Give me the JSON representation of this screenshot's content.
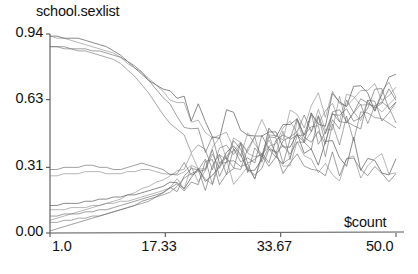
{
  "chart_data": {
    "type": "line",
    "title": "school.sexlist",
    "xlabel": "$count",
    "ylabel": "",
    "xlim": [
      1.0,
      50.0
    ],
    "ylim": [
      0.0,
      0.94
    ],
    "grid": false,
    "legend": false,
    "xticks": [
      1.0,
      17.33,
      33.67,
      50.0
    ],
    "xticklabels": [
      "1.0",
      "17.33",
      "33.67",
      "50.0"
    ],
    "yticks": [
      0.0,
      0.31,
      0.63,
      0.94
    ],
    "yticklabels": [
      "0.00",
      "0.31",
      "0.63",
      "0.94"
    ],
    "line_color": "#6e6e6e",
    "axis_color": "#555555",
    "x": [
      1,
      2,
      3,
      4,
      5,
      6,
      7,
      8,
      9,
      10,
      11,
      12,
      13,
      14,
      15,
      16,
      17,
      18,
      19,
      20,
      21,
      22,
      23,
      24,
      25,
      26,
      27,
      28,
      29,
      30,
      31,
      32,
      33,
      34,
      35,
      36,
      37,
      38,
      39,
      40,
      41,
      42,
      43,
      44,
      45,
      46,
      47,
      48,
      49,
      50
    ],
    "series": [
      {
        "name": "trace-1",
        "values": [
          0.93,
          0.93,
          0.92,
          0.92,
          0.92,
          0.91,
          0.9,
          0.89,
          0.88,
          0.86,
          0.84,
          0.81,
          0.78,
          0.75,
          0.72,
          0.7,
          0.68,
          0.66,
          0.63,
          0.61,
          0.58,
          0.56,
          0.55,
          0.53,
          0.52,
          0.5,
          0.49,
          0.48,
          0.47,
          0.45,
          0.44,
          0.43,
          0.43,
          0.42,
          0.41,
          0.41,
          0.4,
          0.4,
          0.39,
          0.39,
          0.38,
          0.38,
          0.37,
          0.37,
          0.36,
          0.36,
          0.35,
          0.35,
          0.34,
          0.33
        ]
      },
      {
        "name": "trace-2",
        "values": [
          0.93,
          0.92,
          0.92,
          0.91,
          0.9,
          0.89,
          0.88,
          0.87,
          0.86,
          0.85,
          0.83,
          0.8,
          0.78,
          0.76,
          0.73,
          0.7,
          0.67,
          0.64,
          0.61,
          0.58,
          0.55,
          0.52,
          0.5,
          0.48,
          0.46,
          0.44,
          0.43,
          0.42,
          0.41,
          0.4,
          0.39,
          0.38,
          0.37,
          0.37,
          0.36,
          0.36,
          0.35,
          0.35,
          0.34,
          0.34,
          0.33,
          0.33,
          0.32,
          0.32,
          0.32,
          0.31,
          0.31,
          0.31,
          0.3,
          0.3
        ]
      },
      {
        "name": "trace-3",
        "values": [
          0.88,
          0.88,
          0.88,
          0.87,
          0.87,
          0.87,
          0.86,
          0.86,
          0.85,
          0.84,
          0.83,
          0.81,
          0.79,
          0.76,
          0.72,
          0.68,
          0.64,
          0.6,
          0.55,
          0.5,
          0.46,
          0.43,
          0.41,
          0.39,
          0.38,
          0.37,
          0.36,
          0.36,
          0.35,
          0.35,
          0.34,
          0.34,
          0.34,
          0.33,
          0.33,
          0.33,
          0.33,
          0.33,
          0.32,
          0.32,
          0.32,
          0.32,
          0.32,
          0.32,
          0.31,
          0.31,
          0.31,
          0.31,
          0.31,
          0.3
        ]
      },
      {
        "name": "trace-4",
        "values": [
          0.88,
          0.88,
          0.87,
          0.87,
          0.86,
          0.86,
          0.85,
          0.84,
          0.83,
          0.82,
          0.8,
          0.77,
          0.74,
          0.7,
          0.66,
          0.61,
          0.56,
          0.51,
          0.47,
          0.44,
          0.41,
          0.39,
          0.38,
          0.37,
          0.36,
          0.36,
          0.36,
          0.36,
          0.36,
          0.36,
          0.37,
          0.37,
          0.38,
          0.38,
          0.39,
          0.4,
          0.41,
          0.42,
          0.43,
          0.44,
          0.45,
          0.46,
          0.47,
          0.48,
          0.5,
          0.51,
          0.52,
          0.53,
          0.54,
          0.55
        ]
      },
      {
        "name": "trace-5",
        "values": [
          0.3,
          0.3,
          0.31,
          0.31,
          0.31,
          0.32,
          0.32,
          0.31,
          0.31,
          0.3,
          0.3,
          0.31,
          0.32,
          0.33,
          0.32,
          0.31,
          0.3,
          0.29,
          0.3,
          0.31,
          0.32,
          0.31,
          0.3,
          0.31,
          0.32,
          0.33,
          0.34,
          0.33,
          0.32,
          0.33,
          0.34,
          0.36,
          0.37,
          0.38,
          0.4,
          0.42,
          0.44,
          0.46,
          0.48,
          0.5,
          0.52,
          0.55,
          0.57,
          0.59,
          0.61,
          0.62,
          0.63,
          0.64,
          0.65,
          0.66
        ]
      },
      {
        "name": "trace-6",
        "values": [
          0.27,
          0.27,
          0.28,
          0.28,
          0.28,
          0.29,
          0.29,
          0.29,
          0.28,
          0.28,
          0.28,
          0.29,
          0.29,
          0.3,
          0.3,
          0.29,
          0.28,
          0.27,
          0.27,
          0.28,
          0.29,
          0.3,
          0.29,
          0.28,
          0.29,
          0.3,
          0.31,
          0.3,
          0.31,
          0.33,
          0.35,
          0.37,
          0.39,
          0.41,
          0.43,
          0.45,
          0.47,
          0.49,
          0.51,
          0.53,
          0.55,
          0.57,
          0.58,
          0.6,
          0.61,
          0.62,
          0.63,
          0.64,
          0.64,
          0.65
        ]
      },
      {
        "name": "trace-7",
        "values": [
          0.13,
          0.13,
          0.14,
          0.14,
          0.14,
          0.15,
          0.15,
          0.16,
          0.16,
          0.17,
          0.17,
          0.18,
          0.18,
          0.19,
          0.2,
          0.21,
          0.22,
          0.23,
          0.24,
          0.25,
          0.26,
          0.27,
          0.28,
          0.29,
          0.3,
          0.32,
          0.33,
          0.35,
          0.36,
          0.38,
          0.4,
          0.42,
          0.44,
          0.46,
          0.48,
          0.5,
          0.52,
          0.54,
          0.56,
          0.58,
          0.59,
          0.61,
          0.62,
          0.63,
          0.64,
          0.65,
          0.66,
          0.67,
          0.68,
          0.68
        ]
      },
      {
        "name": "trace-8",
        "values": [
          0.11,
          0.11,
          0.11,
          0.12,
          0.12,
          0.12,
          0.13,
          0.13,
          0.14,
          0.14,
          0.15,
          0.15,
          0.16,
          0.17,
          0.18,
          0.19,
          0.2,
          0.22,
          0.23,
          0.25,
          0.26,
          0.28,
          0.29,
          0.31,
          0.32,
          0.34,
          0.35,
          0.37,
          0.38,
          0.4,
          0.41,
          0.43,
          0.44,
          0.46,
          0.47,
          0.49,
          0.5,
          0.52,
          0.53,
          0.55,
          0.56,
          0.58,
          0.59,
          0.6,
          0.61,
          0.62,
          0.63,
          0.64,
          0.64,
          0.65
        ]
      },
      {
        "name": "trace-9",
        "values": [
          0.08,
          0.08,
          0.09,
          0.09,
          0.09,
          0.1,
          0.1,
          0.11,
          0.11,
          0.12,
          0.13,
          0.14,
          0.15,
          0.16,
          0.17,
          0.18,
          0.19,
          0.21,
          0.22,
          0.24,
          0.25,
          0.27,
          0.28,
          0.3,
          0.31,
          0.33,
          0.35,
          0.36,
          0.38,
          0.39,
          0.41,
          0.42,
          0.44,
          0.45,
          0.47,
          0.48,
          0.5,
          0.51,
          0.52,
          0.54,
          0.55,
          0.56,
          0.57,
          0.58,
          0.59,
          0.6,
          0.61,
          0.62,
          0.62,
          0.63
        ]
      },
      {
        "name": "trace-10",
        "values": [
          0.05,
          0.05,
          0.06,
          0.06,
          0.07,
          0.07,
          0.08,
          0.08,
          0.09,
          0.1,
          0.11,
          0.12,
          0.13,
          0.14,
          0.15,
          0.17,
          0.18,
          0.2,
          0.21,
          0.23,
          0.24,
          0.26,
          0.27,
          0.29,
          0.3,
          0.32,
          0.33,
          0.35,
          0.36,
          0.38,
          0.39,
          0.41,
          0.42,
          0.43,
          0.45,
          0.46,
          0.47,
          0.49,
          0.5,
          0.51,
          0.52,
          0.53,
          0.54,
          0.55,
          0.56,
          0.57,
          0.58,
          0.58,
          0.59,
          0.6
        ]
      },
      {
        "name": "trace-11",
        "values": [
          0.01,
          0.02,
          0.03,
          0.04,
          0.05,
          0.06,
          0.07,
          0.08,
          0.09,
          0.1,
          0.11,
          0.12,
          0.13,
          0.15,
          0.16,
          0.17,
          0.19,
          0.2,
          0.22,
          0.23,
          0.25,
          0.26,
          0.28,
          0.29,
          0.31,
          0.32,
          0.34,
          0.35,
          0.37,
          0.38,
          0.4,
          0.41,
          0.42,
          0.44,
          0.45,
          0.46,
          0.47,
          0.48,
          0.49,
          0.5,
          0.51,
          0.52,
          0.53,
          0.54,
          0.55,
          0.55,
          0.56,
          0.57,
          0.57,
          0.58
        ]
      },
      {
        "name": "trace-12",
        "values": [
          0.06,
          0.07,
          0.08,
          0.09,
          0.1,
          0.11,
          0.12,
          0.13,
          0.14,
          0.15,
          0.16,
          0.18,
          0.19,
          0.21,
          0.22,
          0.24,
          0.25,
          0.27,
          0.29,
          0.3,
          0.32,
          0.34,
          0.35,
          0.37,
          0.38,
          0.4,
          0.42,
          0.43,
          0.45,
          0.46,
          0.48,
          0.49,
          0.51,
          0.52,
          0.54,
          0.55,
          0.56,
          0.58,
          0.59,
          0.6,
          0.61,
          0.63,
          0.64,
          0.65,
          0.66,
          0.67,
          0.68,
          0.69,
          0.7,
          0.71
        ]
      }
    ],
    "noise": {
      "start_x": 17,
      "amplitude": 0.085,
      "seed": 7
    }
  }
}
